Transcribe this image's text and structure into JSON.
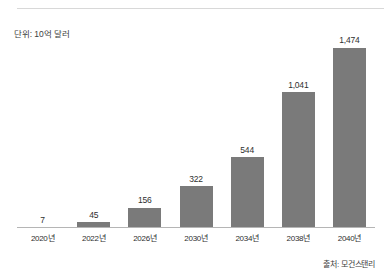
{
  "chart_data": {
    "type": "bar",
    "title": "",
    "subtitle": "",
    "unit_label": "단위: 10억 달러",
    "source_label": "출처: 모건스탠리",
    "xlabel": "",
    "ylabel": "",
    "ylim": [
      0,
      1474
    ],
    "grid": false,
    "legend": "none",
    "axis_top_rule": true,
    "categories": [
      "2020년",
      "2022년",
      "2026년",
      "2030년",
      "2034년",
      "2038년",
      "2040년"
    ],
    "values": [
      7,
      45,
      156,
      322,
      544,
      1041,
      1474
    ],
    "value_labels": [
      "7",
      "45",
      "156",
      "322",
      "544",
      "1,041",
      "1,474"
    ],
    "colors": {
      "bar": "#7a7a7a",
      "baseline": "#b5b5b5",
      "top_rule": "#d8d8d8",
      "text": "#2f2f2f",
      "background": "#ffffff"
    }
  }
}
